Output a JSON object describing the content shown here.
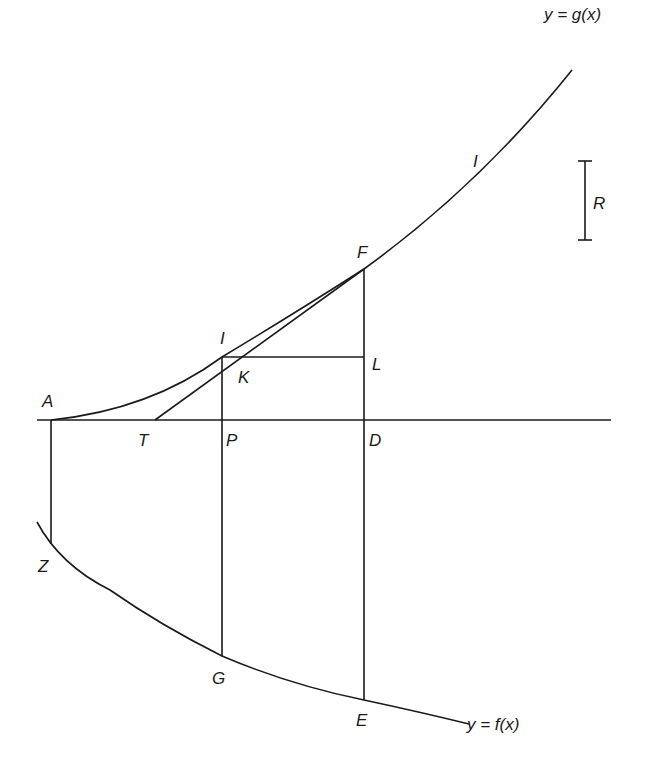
{
  "diagram": {
    "type": "geometric-construction",
    "curves": {
      "g": {
        "label": "y = g(x)",
        "arc_label": "I"
      },
      "f": {
        "label": "y = f(x)"
      }
    },
    "points": {
      "A": "A",
      "T": "T",
      "P": "P",
      "D": "D",
      "I": "I",
      "K": "K",
      "L": "L",
      "F": "F",
      "Z": "Z",
      "G": "G",
      "E": "E"
    },
    "scale_bar": {
      "label": "R"
    }
  }
}
